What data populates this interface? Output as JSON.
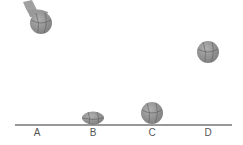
{
  "diagram": {
    "positions": [
      {
        "label": "A",
        "x": 37
      },
      {
        "label": "B",
        "x": 93
      },
      {
        "label": "C",
        "x": 152
      },
      {
        "label": "D",
        "x": 208
      }
    ],
    "colors": {
      "ball": "#8a8a8a",
      "ground": "#333333",
      "hand": "#9a9a9a"
    }
  }
}
